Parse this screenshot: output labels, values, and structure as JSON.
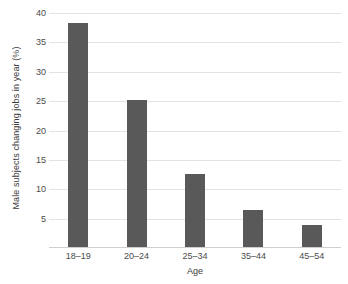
{
  "chart_data": {
    "type": "bar",
    "title": "",
    "subtitle": "",
    "xlabel": "Age",
    "ylabel": "Male subjects changing jobs in year (%)",
    "categories": [
      "18–19",
      "20–24",
      "25–34",
      "35–44",
      "45–54"
    ],
    "values": [
      38.1,
      25.1,
      12.5,
      6.3,
      3.8
    ],
    "series": [
      {
        "name": "Male subjects changing jobs in year (%)",
        "values": [
          38.1,
          25.1,
          12.5,
          6.3,
          3.8
        ]
      }
    ],
    "ylim": [
      0,
      40
    ],
    "xlim_categories": 5,
    "ytick_values": [
      5,
      10,
      15,
      20,
      25,
      30,
      35,
      40
    ],
    "ytick_labels": [
      "5",
      "10",
      "15",
      "20",
      "25",
      "30",
      "35",
      "40"
    ],
    "ytick_step": 5,
    "gridlines": {
      "horizontal": true,
      "vertical": false,
      "color": "#e3e3e3"
    },
    "legend": {
      "visible": false,
      "position": "none",
      "entries": []
    },
    "annotations": [],
    "data_labels_visible": false,
    "colors": {
      "bar_fill": "#595959",
      "background": "#ffffff",
      "gridline": "#e3e3e3",
      "axis_line": "#cfcfcf",
      "tick_text": "#4a4a4a",
      "axis_title_text": "#3b3b3b"
    }
  }
}
